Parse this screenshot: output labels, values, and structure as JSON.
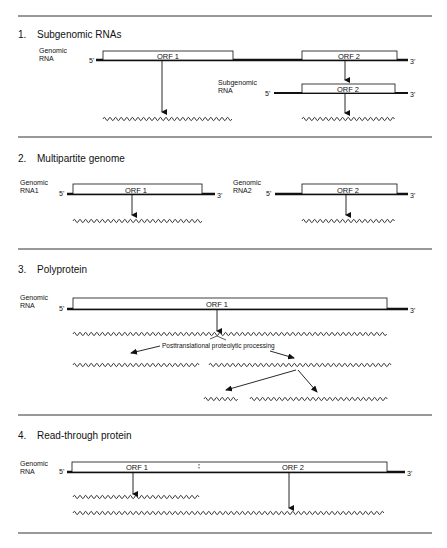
{
  "sections": [
    {
      "number": "1.",
      "title": "Subgenomic RNAs",
      "genomic_label": [
        "Genomic",
        "RNA"
      ],
      "subgenomic_label": [
        "Subgenomic",
        "RNA"
      ],
      "orf1": "ORF 1",
      "orf2": "ORF 2",
      "orf2_sub": "ORF 2",
      "five_prime": "5'",
      "three_prime": "3'"
    },
    {
      "number": "2.",
      "title": "Multipartite genome",
      "rna1_label": [
        "Genomic",
        "RNA1"
      ],
      "rna2_label": [
        "Genomic",
        "RNA2"
      ],
      "orf1": "ORF 1",
      "orf2": "ORF 2",
      "five_prime": "5'",
      "three_prime": "3'"
    },
    {
      "number": "3.",
      "title": "Polyprotein",
      "genomic_label": [
        "Genomic",
        "RNA"
      ],
      "orf1": "ORF 1",
      "processing": "Posttranslational  proteolytic processing",
      "five_prime": "5'",
      "three_prime": "3'"
    },
    {
      "number": "4.",
      "title": "Read-through protein",
      "genomic_label": [
        "Genomic",
        "RNA"
      ],
      "orf1": "ORF 1",
      "orf2": "ORF 2",
      "five_prime": "5'",
      "three_prime": "3'"
    }
  ],
  "colors": {
    "ink": "#111111",
    "rule": "#333333",
    "background": "#ffffff"
  }
}
